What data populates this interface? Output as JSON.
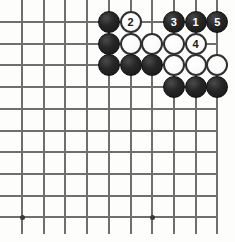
{
  "diagram": {
    "kind": "go-board-diagram",
    "board": {
      "columns": 10,
      "rows": 10,
      "origin_x": 22,
      "origin_y": 22,
      "spacing": 21.7,
      "line_color": "#6f6f70",
      "background_color": "#fdfdfc"
    },
    "star_points": [
      {
        "col": 0,
        "row": 9
      },
      {
        "col": 6,
        "row": 9
      }
    ],
    "colors": {
      "black_stone": "#1d1d1e",
      "white_stone": "#fbfbfa",
      "white_stone_outline": "#2f2f31",
      "black_label_text": "#ffffff",
      "white_label_text": "#1a1a1b"
    },
    "stones": [
      {
        "col": 4,
        "row": 0,
        "color": "black",
        "label": ""
      },
      {
        "col": 5,
        "row": 0,
        "color": "white",
        "label": "2"
      },
      {
        "col": 7,
        "row": 0,
        "color": "black",
        "label": "3"
      },
      {
        "col": 8,
        "row": 0,
        "color": "black",
        "label": "1"
      },
      {
        "col": 9,
        "row": 0,
        "color": "black",
        "label": "5"
      },
      {
        "col": 4,
        "row": 1,
        "color": "black",
        "label": ""
      },
      {
        "col": 5,
        "row": 1,
        "color": "white",
        "label": ""
      },
      {
        "col": 6,
        "row": 1,
        "color": "white",
        "label": ""
      },
      {
        "col": 7,
        "row": 1,
        "color": "white",
        "label": ""
      },
      {
        "col": 8,
        "row": 1,
        "color": "white",
        "label": "4"
      },
      {
        "col": 4,
        "row": 2,
        "color": "black",
        "label": ""
      },
      {
        "col": 5,
        "row": 2,
        "color": "black",
        "label": ""
      },
      {
        "col": 6,
        "row": 2,
        "color": "black",
        "label": ""
      },
      {
        "col": 7,
        "row": 2,
        "color": "white",
        "label": ""
      },
      {
        "col": 8,
        "row": 2,
        "color": "white",
        "label": ""
      },
      {
        "col": 9,
        "row": 2,
        "color": "white",
        "label": ""
      },
      {
        "col": 7,
        "row": 3,
        "color": "black",
        "label": ""
      },
      {
        "col": 8,
        "row": 3,
        "color": "black",
        "label": ""
      },
      {
        "col": 9,
        "row": 3,
        "color": "black",
        "label": ""
      }
    ],
    "move_numbers": [
      "1",
      "2",
      "3",
      "4",
      "5"
    ]
  }
}
